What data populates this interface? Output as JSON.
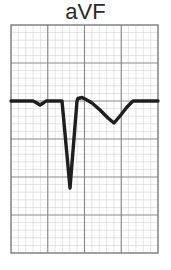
{
  "lead": {
    "title": "aVF"
  },
  "grid": {
    "left": 11,
    "top": 25,
    "right": 158,
    "bottom": 253,
    "major_cols": 4,
    "major_rows": 6,
    "minor_per_major": 5,
    "major_color": "#8a8a8a",
    "minor_color": "#d2d2d2",
    "border_color": "#7a7a7a"
  },
  "trace": {
    "color": "#1e1e1e",
    "width": 3.4,
    "baseline_y": 101,
    "points": [
      [
        11,
        101
      ],
      [
        33,
        101
      ],
      [
        36,
        102.5
      ],
      [
        40,
        105
      ],
      [
        44,
        102.5
      ],
      [
        46,
        101
      ],
      [
        62,
        101
      ],
      [
        70,
        188
      ],
      [
        77,
        101
      ],
      [
        78,
        98.5
      ],
      [
        82,
        97.5
      ],
      [
        86,
        99.5
      ],
      [
        92,
        103
      ],
      [
        100,
        110
      ],
      [
        108,
        118
      ],
      [
        114,
        123
      ],
      [
        120,
        116
      ],
      [
        127,
        107
      ],
      [
        133,
        101
      ],
      [
        158,
        101
      ]
    ],
    "features": {
      "p_wave": "inverted, small",
      "qrs": "deep negative QS complex",
      "t_wave": "inverted"
    }
  }
}
